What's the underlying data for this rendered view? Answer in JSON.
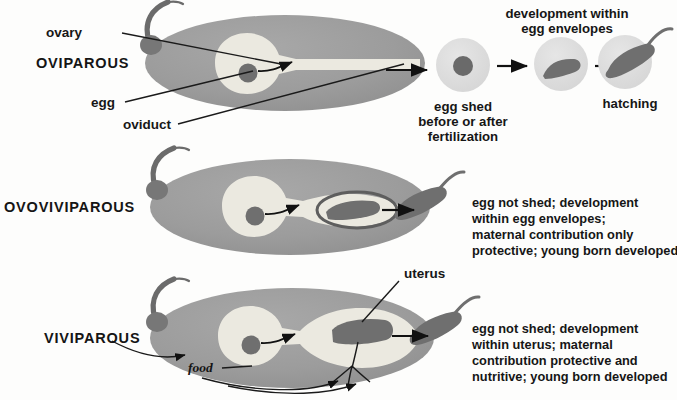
{
  "figure": {
    "title_implicit": "Modes of reproduction: oviparous, ovoviviparous, viviparous",
    "background_color": "#fdfdfc",
    "body_color": "#9d9d9d",
    "organ_light_color": "#ebe9e0",
    "embryo_color": "#6f6f6f",
    "egg_capsule_color": "#dedede",
    "ink_color": "#161616"
  },
  "rows": [
    {
      "id": "oviparous",
      "mode_label": "OVIPAROUS",
      "part_labels": [
        {
          "name": "ovary",
          "text": "ovary"
        },
        {
          "name": "egg",
          "text": "egg"
        },
        {
          "name": "oviduct",
          "text": "oviduct"
        }
      ],
      "captions": [
        {
          "name": "development-caption",
          "lines": [
            "development within",
            "egg envelopes"
          ]
        },
        {
          "name": "egg-shed-caption",
          "lines": [
            "egg shed",
            "before or after",
            "fertilization"
          ]
        },
        {
          "name": "hatching-caption",
          "lines": [
            "hatching"
          ]
        }
      ]
    },
    {
      "id": "ovoviviparous",
      "mode_label": "OVOVIVIPAROUS",
      "part_labels": [],
      "description_lines": [
        "egg not shed; development",
        "within egg envelopes;",
        "maternal contribution only",
        "protective; young born developed"
      ]
    },
    {
      "id": "viviparous",
      "mode_label": "VIVIPAROUS",
      "part_labels": [
        {
          "name": "uterus",
          "text": "uterus"
        },
        {
          "name": "food",
          "text": "food"
        }
      ],
      "description_lines": [
        "egg not shed; development",
        "within uterus; maternal",
        "contribution protective and",
        "nutritive; young born developed"
      ]
    }
  ]
}
